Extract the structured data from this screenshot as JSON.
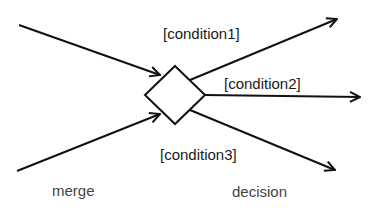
{
  "diagram": {
    "type": "UML activity merge/decision node",
    "node": {
      "shape": "diamond"
    },
    "incoming_edges": 2,
    "outgoing_edges": [
      {
        "guard": "[condition1]"
      },
      {
        "guard": "[condition2]"
      },
      {
        "guard": "[condition3]"
      }
    ],
    "captions": {
      "left": "merge",
      "right": "decision"
    },
    "colors": {
      "stroke": "#111111",
      "background": "#ffffff",
      "caption": "#444444"
    }
  }
}
